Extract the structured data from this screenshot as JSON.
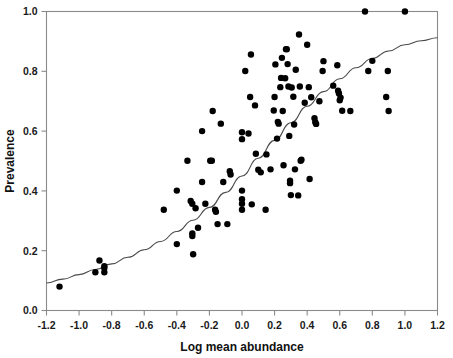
{
  "chart_data": {
    "type": "scatter",
    "title": "",
    "subtitle": "",
    "xlabel": "Log mean abundance",
    "ylabel": "Prevalence",
    "xlim": [
      -1.2,
      1.2
    ],
    "ylim": [
      0.0,
      1.0
    ],
    "xticks": [
      -1.2,
      -1.0,
      -0.8,
      -0.6,
      -0.4,
      -0.2,
      0.0,
      0.2,
      0.4,
      0.6,
      0.8,
      1.0,
      1.2
    ],
    "xticklabels": [
      "-1.2",
      "-1.0",
      "-0.8",
      "-0.6",
      "-0.4",
      "-0.2",
      "0.0",
      "0.2",
      "0.4",
      "0.6",
      "0.8",
      "1.0",
      "1.2"
    ],
    "yticks": [
      0.0,
      0.2,
      0.4,
      0.6,
      0.8,
      1.0
    ],
    "yticklabels": [
      "0.0",
      "0.2",
      "0.4",
      "0.6",
      "0.8",
      "1.0"
    ],
    "grid": false,
    "legend": null,
    "legend_position": "none",
    "point_color": "#000000",
    "curve_color": "#4a4a4a",
    "frame_color": "#8a8a8a",
    "marker_size_px": 3.2,
    "series": [
      {
        "name": "observations",
        "type": "scatter",
        "points": [
          [
            -1.12,
            0.08
          ],
          [
            -0.9,
            0.128
          ],
          [
            -0.875,
            0.167
          ],
          [
            -0.845,
            0.148
          ],
          [
            -0.845,
            0.142
          ],
          [
            -0.845,
            0.128
          ],
          [
            -0.48,
            0.337
          ],
          [
            -0.4,
            0.401
          ],
          [
            -0.4,
            0.222
          ],
          [
            -0.335,
            0.501
          ],
          [
            -0.315,
            0.366
          ],
          [
            -0.305,
            0.357
          ],
          [
            -0.305,
            0.258
          ],
          [
            -0.305,
            0.249
          ],
          [
            -0.3,
            0.188
          ],
          [
            -0.285,
            0.342
          ],
          [
            -0.27,
            0.277
          ],
          [
            -0.245,
            0.6
          ],
          [
            -0.245,
            0.43
          ],
          [
            -0.225,
            0.357
          ],
          [
            -0.195,
            0.501
          ],
          [
            -0.185,
            0.501
          ],
          [
            -0.18,
            0.667
          ],
          [
            -0.165,
            0.337
          ],
          [
            -0.16,
            0.33
          ],
          [
            -0.15,
            0.289
          ],
          [
            -0.13,
            0.625
          ],
          [
            -0.115,
            0.43
          ],
          [
            -0.09,
            0.289
          ],
          [
            -0.075,
            0.466
          ],
          [
            -0.07,
            0.455
          ],
          [
            0.0,
            0.573
          ],
          [
            0.0,
            0.596
          ],
          [
            0.0,
            0.401
          ],
          [
            0.0,
            0.372
          ],
          [
            0.0,
            0.357
          ],
          [
            0.0,
            0.337
          ],
          [
            0.02,
            0.801
          ],
          [
            0.04,
            0.592
          ],
          [
            0.05,
            0.714
          ],
          [
            0.055,
            0.856
          ],
          [
            0.06,
            0.355
          ],
          [
            0.08,
            0.686
          ],
          [
            0.085,
            0.524
          ],
          [
            0.1,
            0.471
          ],
          [
            0.115,
            0.462
          ],
          [
            0.145,
            0.337
          ],
          [
            0.15,
            0.522
          ],
          [
            0.175,
            0.472
          ],
          [
            0.195,
            0.669
          ],
          [
            0.2,
            0.714
          ],
          [
            0.205,
            0.823
          ],
          [
            0.215,
            0.575
          ],
          [
            0.22,
            0.631
          ],
          [
            0.225,
            0.625
          ],
          [
            0.235,
            0.747
          ],
          [
            0.24,
            0.778
          ],
          [
            0.245,
            0.845
          ],
          [
            0.25,
            0.667
          ],
          [
            0.255,
            0.486
          ],
          [
            0.265,
            0.777
          ],
          [
            0.27,
            0.874
          ],
          [
            0.275,
            0.874
          ],
          [
            0.28,
            0.824
          ],
          [
            0.285,
            0.749
          ],
          [
            0.29,
            0.584
          ],
          [
            0.295,
            0.434
          ],
          [
            0.295,
            0.426
          ],
          [
            0.3,
            0.386
          ],
          [
            0.305,
            0.746
          ],
          [
            0.315,
            0.715
          ],
          [
            0.32,
            0.622
          ],
          [
            0.325,
            0.472
          ],
          [
            0.33,
            0.805
          ],
          [
            0.345,
            0.385
          ],
          [
            0.35,
            0.923
          ],
          [
            0.355,
            0.749
          ],
          [
            0.36,
            0.501
          ],
          [
            0.365,
            0.504
          ],
          [
            0.385,
            0.695
          ],
          [
            0.4,
            0.889
          ],
          [
            0.41,
            0.747
          ],
          [
            0.415,
            0.44
          ],
          [
            0.425,
            0.713
          ],
          [
            0.445,
            0.643
          ],
          [
            0.45,
            0.63
          ],
          [
            0.455,
            0.624
          ],
          [
            0.475,
            0.7
          ],
          [
            0.495,
            0.801
          ],
          [
            0.5,
            0.834
          ],
          [
            0.56,
            0.752
          ],
          [
            0.585,
            0.82
          ],
          [
            0.59,
            0.735
          ],
          [
            0.595,
            0.726
          ],
          [
            0.6,
            0.703
          ],
          [
            0.605,
            0.712
          ],
          [
            0.615,
            0.668
          ],
          [
            0.665,
            0.667
          ],
          [
            0.755,
            1.0
          ],
          [
            0.775,
            0.801
          ],
          [
            0.8,
            0.835
          ],
          [
            0.885,
            0.714
          ],
          [
            0.895,
            0.801
          ],
          [
            0.9,
            0.667
          ],
          [
            1.0,
            1.0
          ]
        ]
      },
      {
        "name": "logistic-fit",
        "type": "line",
        "description": "monotonic sigmoid fitted curve",
        "points": [
          [
            -1.2,
            0.092
          ],
          [
            -1.1,
            0.105
          ],
          [
            -1.0,
            0.12
          ],
          [
            -0.9,
            0.137
          ],
          [
            -0.8,
            0.156
          ],
          [
            -0.7,
            0.178
          ],
          [
            -0.6,
            0.203
          ],
          [
            -0.5,
            0.231
          ],
          [
            -0.4,
            0.264
          ],
          [
            -0.3,
            0.302
          ],
          [
            -0.2,
            0.345
          ],
          [
            -0.1,
            0.395
          ],
          [
            0.0,
            0.45
          ],
          [
            0.1,
            0.509
          ],
          [
            0.2,
            0.569
          ],
          [
            0.3,
            0.628
          ],
          [
            0.4,
            0.683
          ],
          [
            0.5,
            0.732
          ],
          [
            0.6,
            0.775
          ],
          [
            0.7,
            0.812
          ],
          [
            0.8,
            0.843
          ],
          [
            0.9,
            0.868
          ],
          [
            1.0,
            0.889
          ],
          [
            1.1,
            0.902
          ],
          [
            1.2,
            0.912
          ]
        ]
      }
    ]
  }
}
